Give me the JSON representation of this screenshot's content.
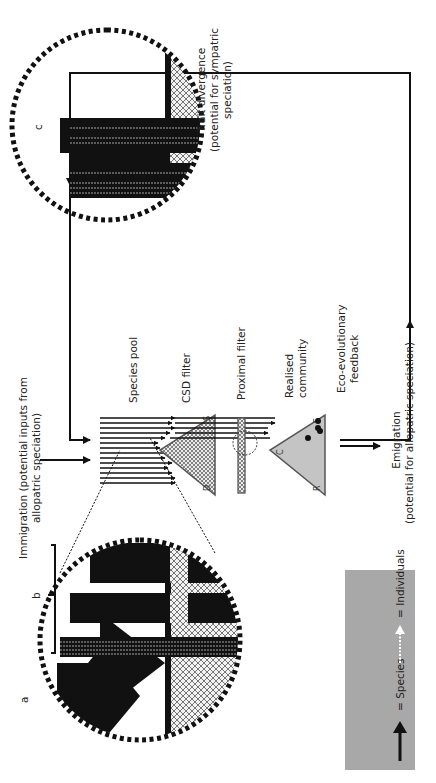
{
  "orientation": "rotated-90-counterclockwise",
  "legend": {
    "species_label": "= Species",
    "individuals_label": "= Individuals",
    "background": "#a8a8a8"
  },
  "panels": {
    "a": {
      "label": "a"
    },
    "b": {
      "label": "b"
    },
    "c": {
      "label": "c"
    }
  },
  "labels": {
    "immigration_line1": "Immigration (potential inputs from",
    "immigration_line2": "allopatric speciation)",
    "species_pool": "Species pool",
    "csd_filter": "CSD filter",
    "proximal_filter": "Proximal filter",
    "realised_line1": "Realised",
    "realised_line2": "community",
    "feedback_line1": "Eco-evolutionary",
    "feedback_line2": "feedback",
    "emigration_line1": "Emigration",
    "emigration_line2": "(potential for allopatric speciation)",
    "trait_line1": "Trait divergence",
    "trait_line2": "(potential for sympatric",
    "trait_line3": "speciation)"
  },
  "triangle_vertices": {
    "csd": {
      "top": "S",
      "bottom": "D"
    },
    "realised": {
      "left": "C",
      "top": "S",
      "bottom": "R"
    }
  },
  "colors": {
    "black": "#111111",
    "grey_fill": "#c4c4c4",
    "legend_grey": "#a8a8a8",
    "hatch": "#555555"
  }
}
